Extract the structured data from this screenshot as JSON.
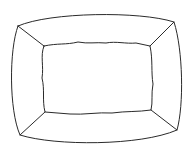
{
  "figure": {
    "stroke_color": "#2a2a2a",
    "background": "#ffffff"
  }
}
